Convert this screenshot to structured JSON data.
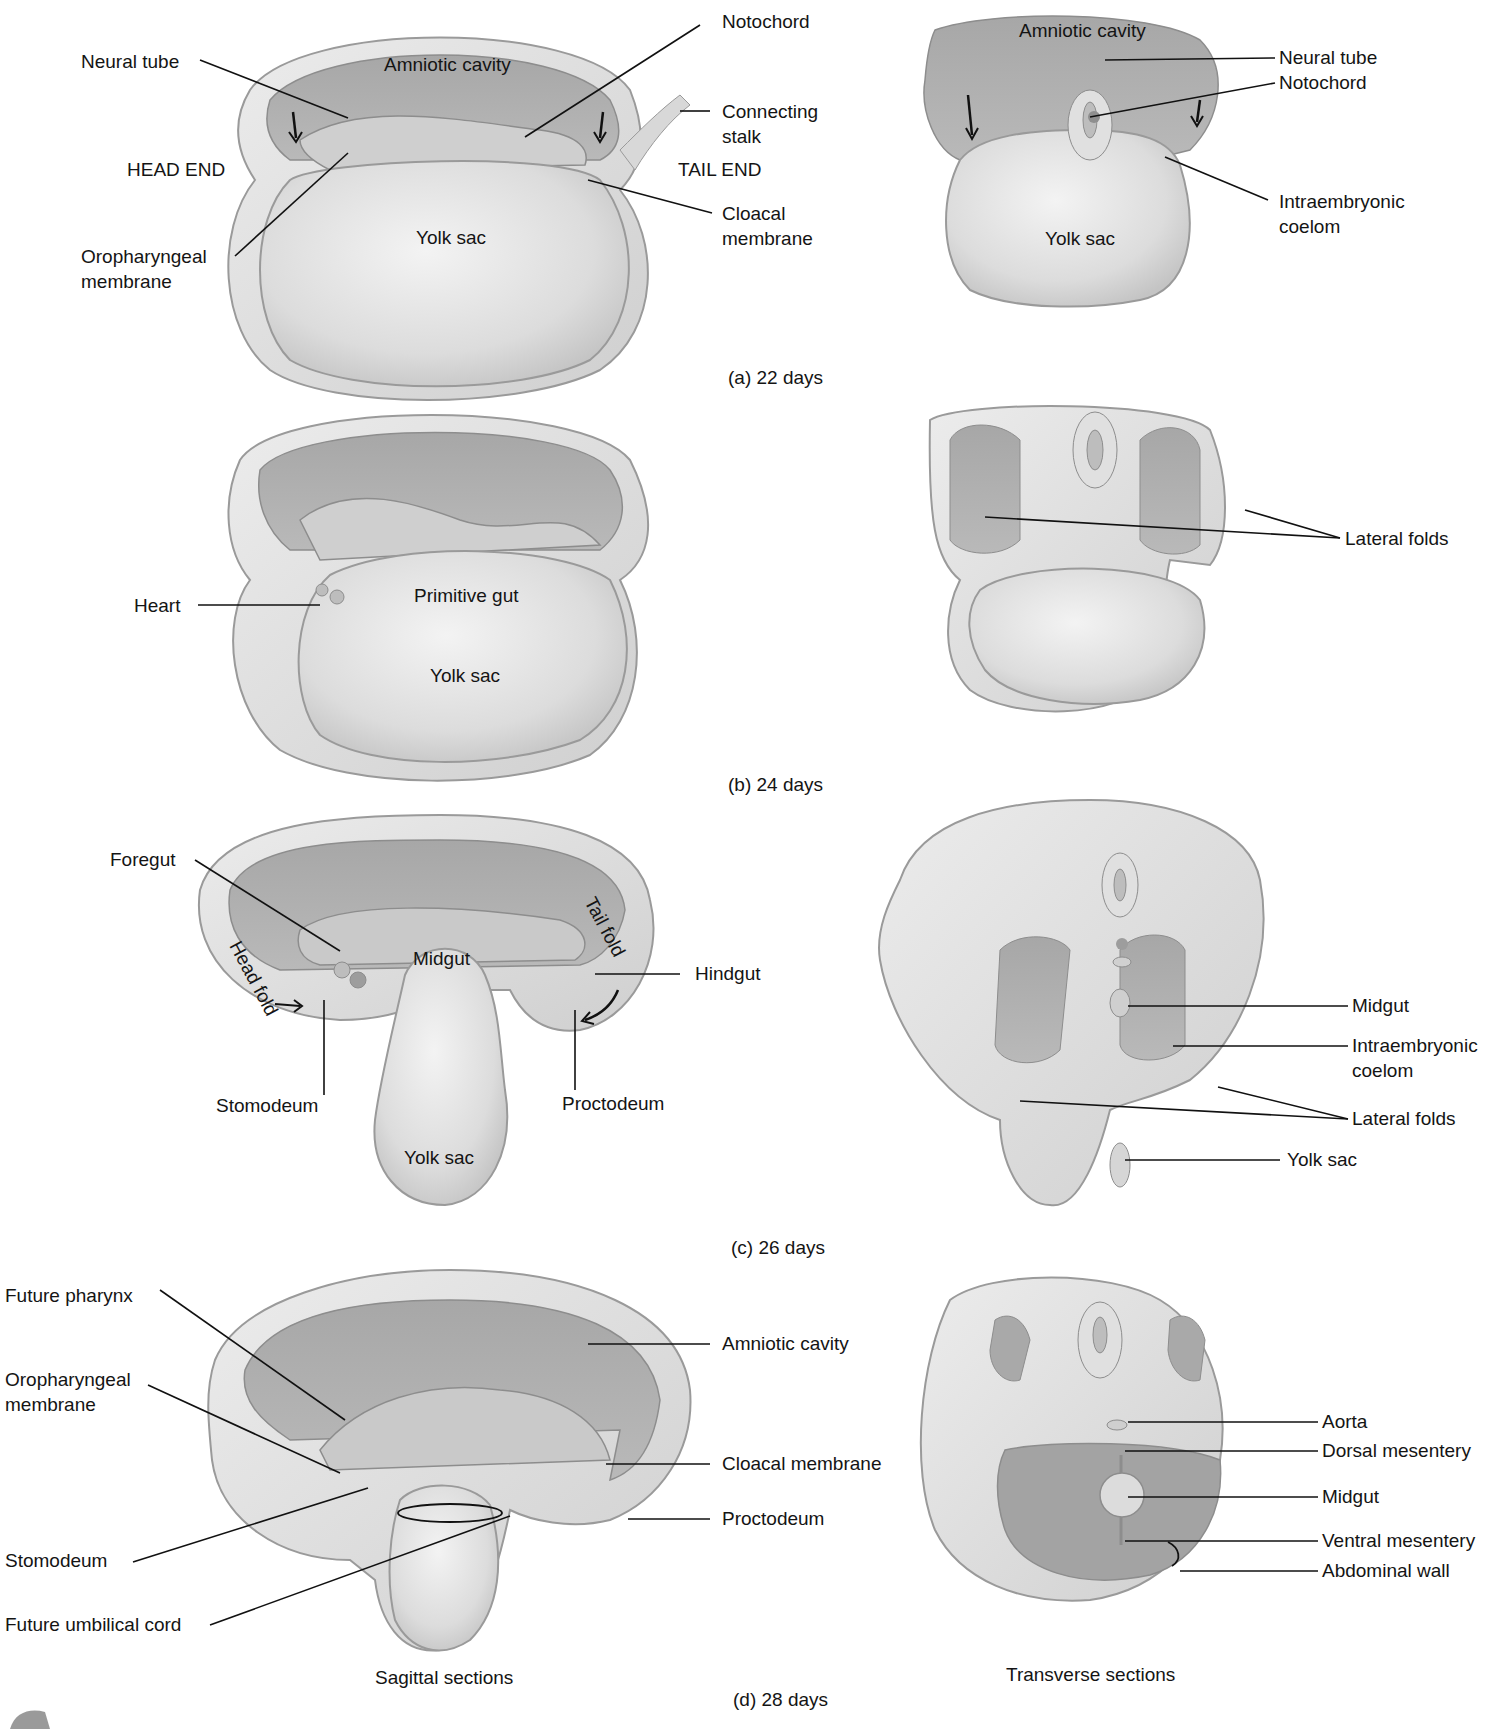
{
  "figure": {
    "panels": [
      {
        "id": "a",
        "caption": "(a) 22 days",
        "sagittal_labels": {
          "neural_tube": "Neural tube",
          "amniotic_cavity": "Amniotic cavity",
          "notochord": "Notochord",
          "connecting_stalk_1": "Connecting",
          "connecting_stalk_2": "stalk",
          "head_end": "HEAD END",
          "tail_end": "TAIL END",
          "yolk_sac": "Yolk sac",
          "oropharyngeal_1": "Oropharyngeal",
          "oropharyngeal_2": "membrane",
          "cloacal_1": "Cloacal",
          "cloacal_2": "membrane"
        },
        "transverse_labels": {
          "amniotic_cavity": "Amniotic cavity",
          "neural_tube": "Neural tube",
          "notochord": "Notochord",
          "intraembryonic_1": "Intraembryonic",
          "intraembryonic_2": "coelom",
          "yolk_sac": "Yolk sac"
        }
      },
      {
        "id": "b",
        "caption": "(b) 24 days",
        "sagittal_labels": {
          "heart": "Heart",
          "primitive_gut": "Primitive gut",
          "yolk_sac": "Yolk sac"
        },
        "transverse_labels": {
          "lateral_folds": "Lateral folds"
        }
      },
      {
        "id": "c",
        "caption": "(c) 26 days",
        "sagittal_labels": {
          "foregut": "Foregut",
          "tail_fold": "Tail fold",
          "head_fold": "Head fold",
          "midgut": "Midgut",
          "hindgut": "Hindgut",
          "stomodeum": "Stomodeum",
          "proctodeum": "Proctodeum",
          "yolk_sac": "Yolk sac"
        },
        "transverse_labels": {
          "midgut": "Midgut",
          "intraembryonic_1": "Intraembryonic",
          "intraembryonic_2": "coelom",
          "lateral_folds": "Lateral folds",
          "yolk_sac": "Yolk sac"
        }
      },
      {
        "id": "d",
        "caption": "(d) 28 days",
        "sagittal_labels": {
          "future_pharynx": "Future pharynx",
          "oropharyngeal_1": "Oropharyngeal",
          "oropharyngeal_2": "membrane",
          "stomodeum": "Stomodeum",
          "future_umbilical_cord": "Future umbilical cord",
          "amniotic_cavity": "Amniotic cavity",
          "cloacal_membrane": "Cloacal membrane",
          "proctodeum": "Proctodeum"
        },
        "transverse_labels": {
          "aorta": "Aorta",
          "dorsal_mesentery": "Dorsal mesentery",
          "midgut": "Midgut",
          "ventral_mesentery": "Ventral mesentery",
          "abdominal_wall": "Abdominal wall"
        }
      }
    ],
    "column_titles": {
      "sagittal": "Sagittal sections",
      "transverse": "Transverse sections"
    }
  },
  "colors": {
    "background": "#ffffff",
    "tissue_light": "#e6e6e6",
    "tissue_mid": "#c9c9c9",
    "cavity_dark": "#9d9d9d",
    "outline": "#8a8a8a",
    "leader_line": "#111111"
  }
}
